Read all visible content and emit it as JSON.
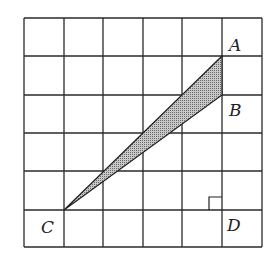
{
  "diagram": {
    "grid": {
      "columns": 6,
      "rows": 6,
      "x_lines": [
        24,
        64,
        103,
        143,
        182,
        222,
        262
      ],
      "y_lines": [
        18,
        56,
        95,
        133,
        171,
        210,
        247
      ]
    },
    "points": {
      "A": {
        "label": "A",
        "x": 222,
        "y": 56,
        "label_x": 229,
        "label_y": 51
      },
      "B": {
        "label": "B",
        "x": 222,
        "y": 95,
        "label_x": 229,
        "label_y": 116
      },
      "C": {
        "label": "C",
        "x": 64,
        "y": 210,
        "label_x": 41,
        "label_y": 233
      },
      "D": {
        "label": "D",
        "x": 222,
        "y": 210,
        "label_x": 227,
        "label_y": 231
      }
    },
    "shaded_triangle": [
      "A",
      "B",
      "C"
    ],
    "shade_color": "#a8a8a8",
    "right_angle_marker": {
      "at": "D",
      "size": 13
    }
  }
}
